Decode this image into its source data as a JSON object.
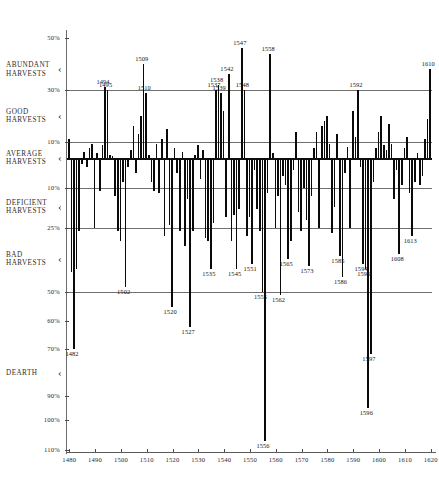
{
  "chart_data": {
    "type": "bar",
    "title": "",
    "subtitle": "",
    "xlabel": "",
    "ylabel": "",
    "xlim": [
      1479,
      1621
    ],
    "ylim": [
      50,
      -110
    ],
    "grid": true,
    "legend_position": "none",
    "orientation": "vertical",
    "note": "Deviation of harvest quality from average, percent. Positive = better than average harvest, negative = worse.",
    "y_axis_ticks": [
      {
        "label": "50%",
        "value": 50
      },
      {
        "label": "30%",
        "value": 30
      },
      {
        "label": "10%",
        "value": 10
      },
      {
        "label": "10%",
        "value": -10
      },
      {
        "label": "25%",
        "value": -25
      },
      {
        "label": "50%",
        "value": -50
      },
      {
        "label": "60%",
        "value": -60
      },
      {
        "label": "70%",
        "value": -70
      },
      {
        "label": "90%",
        "value": -90
      },
      {
        "label": "100%",
        "value": -100
      },
      {
        "label": "110%",
        "value": -110
      }
    ],
    "y_band_labels": [
      {
        "text": "ABUNDANT\nHARVESTS",
        "value": 38
      },
      {
        "text": "GOOD\nHARVESTS",
        "value": 20
      },
      {
        "text": "AVERAGE\nHARVESTS",
        "value": 0
      },
      {
        "text": "DEFICIENT\nHARVESTS",
        "value": -17
      },
      {
        "text": "BAD\nHARVESTS",
        "value": -37
      },
      {
        "text": "DEARTH",
        "value": -80
      }
    ],
    "x_axis_ticks": [
      {
        "label": "1480",
        "value": 1480
      },
      {
        "label": "1490",
        "value": 1490
      },
      {
        "label": "1500",
        "value": 1500
      },
      {
        "label": "1510",
        "value": 1510
      },
      {
        "label": "1520",
        "value": 1520
      },
      {
        "label": "1530",
        "value": 1530
      },
      {
        "label": "1540",
        "value": 1540
      },
      {
        "label": "1550",
        "value": 1550
      },
      {
        "label": "1560",
        "value": 1560
      },
      {
        "label": "1570",
        "value": 1570
      },
      {
        "label": "1580",
        "value": 1580
      },
      {
        "label": "1590",
        "value": 1590
      },
      {
        "label": "1600",
        "value": 1600
      },
      {
        "label": "1610",
        "value": 1610
      },
      {
        "label": "1620",
        "value": 1620
      }
    ],
    "gridline_values": [
      30,
      10,
      -10,
      -25,
      -50
    ],
    "x": [
      1480,
      1481,
      1482,
      1483,
      1484,
      1485,
      1486,
      1487,
      1488,
      1489,
      1490,
      1491,
      1492,
      1493,
      1494,
      1495,
      1496,
      1497,
      1498,
      1499,
      1500,
      1501,
      1502,
      1503,
      1504,
      1505,
      1506,
      1507,
      1508,
      1509,
      1510,
      1511,
      1512,
      1513,
      1514,
      1515,
      1516,
      1517,
      1518,
      1519,
      1520,
      1521,
      1522,
      1523,
      1524,
      1525,
      1526,
      1527,
      1528,
      1529,
      1530,
      1531,
      1532,
      1533,
      1534,
      1535,
      1536,
      1537,
      1538,
      1539,
      1540,
      1541,
      1542,
      1543,
      1544,
      1545,
      1546,
      1547,
      1548,
      1549,
      1550,
      1551,
      1552,
      1553,
      1554,
      1555,
      1556,
      1557,
      1558,
      1559,
      1560,
      1561,
      1562,
      1563,
      1564,
      1565,
      1566,
      1567,
      1568,
      1569,
      1570,
      1571,
      1572,
      1573,
      1574,
      1575,
      1576,
      1577,
      1578,
      1579,
      1580,
      1581,
      1582,
      1583,
      1584,
      1585,
      1586,
      1587,
      1588,
      1589,
      1590,
      1591,
      1592,
      1593,
      1594,
      1595,
      1596,
      1597,
      1598,
      1599,
      1600,
      1601,
      1602,
      1603,
      1604,
      1605,
      1606,
      1607,
      1608,
      1609,
      1610,
      1611,
      1612,
      1613,
      1614,
      1615,
      1616,
      1617,
      1618,
      1619,
      1620
    ],
    "values": [
      11,
      -42,
      -70,
      -41,
      -26,
      -2,
      4,
      -3,
      6,
      9,
      -25,
      3,
      -11,
      8,
      31,
      30,
      2,
      1,
      -13,
      -26,
      -30,
      -8,
      -48,
      -3,
      5,
      16,
      -5,
      13,
      20,
      40,
      29,
      2,
      -8,
      -11,
      9,
      -12,
      11,
      -28,
      15,
      -24,
      -55,
      6,
      -5,
      -26,
      4,
      -32,
      -14,
      -62,
      -26,
      2,
      8,
      -7,
      5,
      -29,
      -30,
      -41,
      -23,
      30,
      32,
      29,
      22,
      -21,
      36,
      -30,
      -20,
      -41,
      -18,
      46,
      30,
      -28,
      -21,
      -39,
      -4,
      -18,
      -26,
      -50,
      -107,
      -12,
      44,
      3,
      -25,
      -13,
      -51,
      -6,
      -9,
      -37,
      -30,
      -4,
      14,
      -19,
      -26,
      -10,
      -22,
      -40,
      -13,
      6,
      14,
      -25,
      16,
      18,
      20,
      9,
      -27,
      -17,
      13,
      -36,
      -44,
      -5,
      7,
      -25,
      22,
      12,
      30,
      -3,
      -39,
      -41,
      -95,
      -72,
      -8,
      6,
      14,
      20,
      8,
      5,
      17,
      9,
      -14,
      -4,
      -35,
      -9,
      6,
      12,
      -12,
      -28,
      -8,
      3,
      -9,
      -6,
      11,
      19,
      38
    ],
    "annotations": [
      {
        "label": "1482",
        "x": 1482,
        "value": -70,
        "side": "below"
      },
      {
        "label": "1494",
        "x": 1494,
        "value": 31,
        "side": "above"
      },
      {
        "label": "1495",
        "x": 1495,
        "value": 30,
        "side": "above"
      },
      {
        "label": "1502",
        "x": 1502,
        "value": -48,
        "side": "below"
      },
      {
        "label": "1509",
        "x": 1509,
        "value": 40,
        "side": "above"
      },
      {
        "label": "1510",
        "x": 1510,
        "value": 29,
        "side": "above"
      },
      {
        "label": "1520",
        "x": 1520,
        "value": -55,
        "side": "below"
      },
      {
        "label": "1527",
        "x": 1527,
        "value": -62,
        "side": "below"
      },
      {
        "label": "1535",
        "x": 1535,
        "value": -41,
        "side": "below"
      },
      {
        "label": "1537",
        "x": 1537,
        "value": 30,
        "side": "above"
      },
      {
        "label": "1538",
        "x": 1538,
        "value": 32,
        "side": "above"
      },
      {
        "label": "1539",
        "x": 1539,
        "value": 29,
        "side": "above"
      },
      {
        "label": "1542",
        "x": 1542,
        "value": 36,
        "side": "above"
      },
      {
        "label": "1545",
        "x": 1545,
        "value": -41,
        "side": "below"
      },
      {
        "label": "1547",
        "x": 1547,
        "value": 46,
        "side": "above"
      },
      {
        "label": "1548",
        "x": 1548,
        "value": 30,
        "side": "above"
      },
      {
        "label": "1551",
        "x": 1551,
        "value": -39,
        "side": "below"
      },
      {
        "label": "1555",
        "x": 1555,
        "value": -50,
        "side": "below"
      },
      {
        "label": "1556",
        "x": 1556,
        "value": -107,
        "side": "below"
      },
      {
        "label": "1558",
        "x": 1558,
        "value": 44,
        "side": "above"
      },
      {
        "label": "1562",
        "x": 1562,
        "value": -51,
        "side": "below"
      },
      {
        "label": "1565",
        "x": 1565,
        "value": -37,
        "side": "below"
      },
      {
        "label": "1573",
        "x": 1573,
        "value": -40,
        "side": "below"
      },
      {
        "label": "1585",
        "x": 1585,
        "value": -36,
        "side": "below"
      },
      {
        "label": "1586",
        "x": 1586,
        "value": -44,
        "side": "below"
      },
      {
        "label": "1592",
        "x": 1592,
        "value": 30,
        "side": "above"
      },
      {
        "label": "1594",
        "x": 1594,
        "value": -39,
        "side": "below"
      },
      {
        "label": "1595",
        "x": 1595,
        "value": -41,
        "side": "below"
      },
      {
        "label": "1596",
        "x": 1596,
        "value": -95,
        "side": "below"
      },
      {
        "label": "1597",
        "x": 1597,
        "value": -72,
        "side": "below"
      },
      {
        "label": "1608",
        "x": 1608,
        "value": -35,
        "side": "below"
      },
      {
        "label": "1610",
        "x": 1620,
        "value": 38,
        "side": "above"
      },
      {
        "label": "1613",
        "x": 1613,
        "value": -28,
        "side": "below"
      }
    ],
    "colors": {
      "bar": "#0a0a0a",
      "axis": "#5a5a5a",
      "grid": "#6f6f6f",
      "text": "#1a1a1a",
      "background": "#ffffff"
    }
  }
}
